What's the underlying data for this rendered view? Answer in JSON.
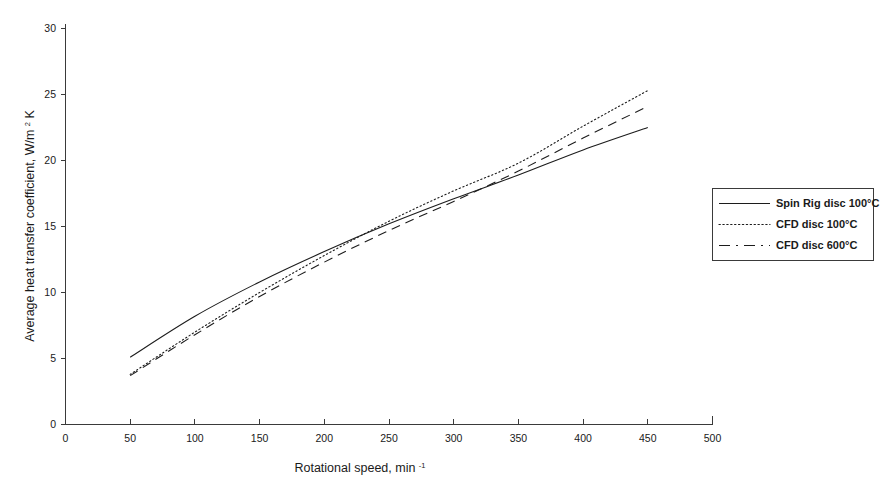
{
  "chart_data": {
    "type": "line",
    "title": "",
    "xlabel": "Rotational speed, min",
    "xlabel_sup": "-1",
    "ylabel": "Average heat transfer coefficient, W/m",
    "ylabel_sup": "2",
    "ylabel_tail": "K",
    "xlim": [
      0,
      500
    ],
    "ylim": [
      0,
      30
    ],
    "xticks": [
      0,
      50,
      100,
      150,
      200,
      250,
      300,
      350,
      400,
      450,
      500
    ],
    "yticks": [
      0,
      5,
      10,
      15,
      20,
      25,
      30
    ],
    "xtick_labels": [
      "0",
      "50",
      "100",
      "150",
      "200",
      "250",
      "300",
      "350",
      "400",
      "450",
      "500"
    ],
    "ytick_labels": [
      "0",
      "5",
      "10",
      "15",
      "20",
      "25",
      "30"
    ],
    "grid": false,
    "legend_position": "right",
    "x": [
      50,
      100,
      150,
      200,
      250,
      300,
      350,
      400,
      450
    ],
    "series": [
      {
        "name": "Spin Rig disc 100°C",
        "style": "solid",
        "values": [
          5.1,
          8.2,
          10.8,
          13.1,
          15.2,
          17.1,
          18.9,
          20.8,
          22.5
        ]
      },
      {
        "name": "CFD disc 100°C",
        "style": "dotted",
        "values": [
          3.8,
          7.0,
          10.0,
          12.8,
          15.4,
          17.7,
          19.8,
          22.6,
          25.3
        ]
      },
      {
        "name": "CFD disc 600°C",
        "style": "dashed",
        "values": [
          3.7,
          6.8,
          9.7,
          12.3,
          14.7,
          16.9,
          19.2,
          21.7,
          24.1
        ]
      }
    ],
    "colors": {
      "axis": "#3a3a3a",
      "series": "#1c1c1c",
      "background": "#ffffff"
    }
  },
  "legend": {
    "entries": [
      {
        "label": "Spin Rig disc 100°C",
        "style": "solid"
      },
      {
        "label": "CFD disc 100°C",
        "style": "dotted"
      },
      {
        "label": "CFD disc 600°C",
        "style": "dashed"
      }
    ]
  }
}
